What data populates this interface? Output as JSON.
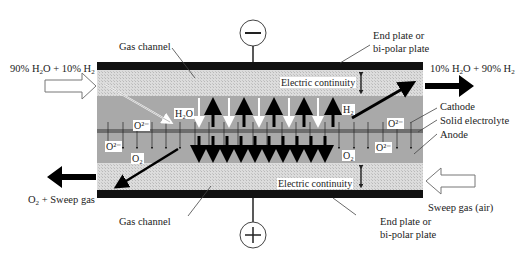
{
  "diagram": {
    "terminals": {
      "top": "−",
      "bottom": "+"
    },
    "labels": {
      "gas_channel_top": "Gas channel",
      "gas_channel_bottom": "Gas channel",
      "end_plate_top_1": "End plate or",
      "end_plate_top_2": "bi-polar plate",
      "end_plate_bottom_1": "End plate or",
      "end_plate_bottom_2": "bi-polar plate",
      "electric_continuity_top": "Electric continuity",
      "electric_continuity_bottom": "Electric continuity",
      "cathode": "Cathode",
      "solid_electrolyte": "Solid electrolyte",
      "anode": "Anode",
      "sweep_gas_in": "Sweep gas (air)",
      "o2_sweep_out": "O",
      "o2_sweep_out_sub": "2",
      "o2_sweep_out_rest": " + Sweep gas"
    },
    "inlet_feed": {
      "pct_h2o": "90%",
      "pct_h2": "10%"
    },
    "outlet_product": {
      "pct_h2o": "10%",
      "pct_h2": "90%"
    },
    "species": {
      "h2o": "H₂O",
      "h2": "H₂",
      "o2": "O₂",
      "o2_ion": "O²⁻"
    },
    "colors": {
      "plate": "#111111",
      "gas_channel": "#d6d6d6",
      "electrode": "#a9a9a9",
      "electrolyte": "#6e6e6e",
      "arrow_dark": "#000000",
      "arrow_light": "#ffffff"
    }
  }
}
